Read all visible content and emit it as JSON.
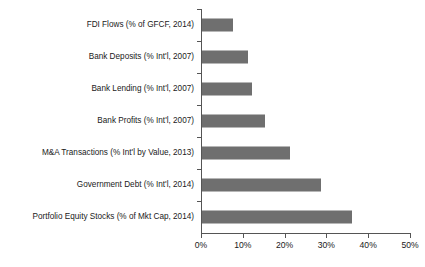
{
  "chart_data": {
    "type": "bar",
    "orientation": "horizontal",
    "title": "",
    "xlabel": "",
    "ylabel": "",
    "xlim": [
      0,
      50
    ],
    "xtick_values": [
      0,
      10,
      20,
      30,
      40,
      50
    ],
    "xtick_labels": [
      "0%",
      "10%",
      "20%",
      "30%",
      "40%",
      "50%"
    ],
    "grid": false,
    "legend": "none",
    "bar_color": "#6f6f6f",
    "axis_color": "#555555",
    "text_color": "#1a1a1a",
    "categories": [
      "FDI Flows (% of GFCF, 2014)",
      "Bank Deposits (% Int'l, 2007)",
      "Bank Lending (% Int'l, 2007)",
      "Bank Profits (% Int'l, 2007)",
      "M&A Transactions (% Int'l by Value, 2013)",
      "Government Debt (% Int'l, 2014)",
      "Portfolio Equity Stocks (% of Mkt Cap, 2014)"
    ],
    "values": [
      7.4,
      11,
      12,
      15,
      21,
      28.5,
      36
    ]
  }
}
